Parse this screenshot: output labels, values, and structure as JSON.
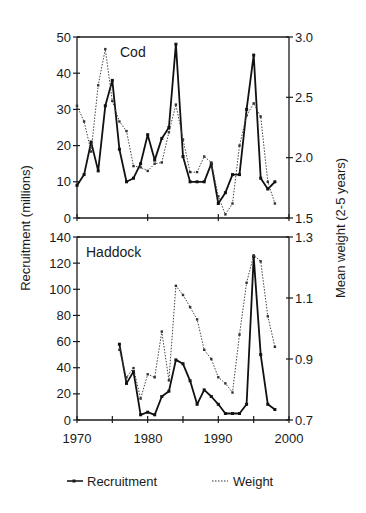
{
  "figure": {
    "left_axis_label": "Recruitment (millions)",
    "right_axis_label": "Mean weight (2-5 years)",
    "x_tick_labels": [
      "1970",
      "1980",
      "1990",
      "2000"
    ],
    "legend": {
      "recruitment": "Recruitment",
      "weight": "Weight"
    }
  },
  "chart_data": [
    {
      "type": "line",
      "title": "Cod",
      "xlabel": "",
      "ylabel": "Recruitment (millions)",
      "y2label": "Mean weight (2-5 years)",
      "xlim": [
        1970,
        2000
      ],
      "ylim": [
        0,
        50
      ],
      "y2lim": [
        1.5,
        3.0
      ],
      "yticks": [
        0,
        10,
        20,
        30,
        40,
        50
      ],
      "y2ticks": [
        1.5,
        2.0,
        2.5,
        3.0
      ],
      "xticks": [
        1970,
        1980,
        1990,
        2000
      ],
      "grid": false,
      "legend_position": "bottom",
      "x": [
        1970,
        1971,
        1972,
        1973,
        1974,
        1975,
        1976,
        1977,
        1978,
        1979,
        1980,
        1981,
        1982,
        1983,
        1984,
        1985,
        1986,
        1987,
        1988,
        1989,
        1990,
        1991,
        1992,
        1993,
        1994,
        1995,
        1996,
        1997,
        1998
      ],
      "series": [
        {
          "name": "Recruitment",
          "axis": "left",
          "style": "solid",
          "values": [
            9,
            12,
            21,
            13,
            31,
            38,
            19,
            10,
            11,
            15,
            23,
            16,
            22,
            25,
            48,
            17,
            10,
            10,
            10,
            15,
            4,
            7,
            12,
            12,
            30,
            45,
            11,
            8,
            10
          ]
        },
        {
          "name": "Weight",
          "axis": "right",
          "style": "dotted",
          "values": [
            2.43,
            2.3,
            2.05,
            2.6,
            2.9,
            2.47,
            2.3,
            2.22,
            1.93,
            1.92,
            1.89,
            1.95,
            1.96,
            2.21,
            2.44,
            2.15,
            1.88,
            1.88,
            2.01,
            1.96,
            1.68,
            1.53,
            1.62,
            2.1,
            2.35,
            2.45,
            2.34,
            1.8,
            1.62
          ]
        }
      ]
    },
    {
      "type": "line",
      "title": "Haddock",
      "xlabel": "",
      "ylabel": "Recruitment (millions)",
      "y2label": "Mean weight (2-5 years)",
      "xlim": [
        1970,
        2000
      ],
      "ylim": [
        0,
        140
      ],
      "y2lim": [
        0.7,
        1.3
      ],
      "yticks": [
        0,
        20,
        40,
        60,
        80,
        100,
        120,
        140
      ],
      "y2ticks": [
        0.7,
        0.9,
        1.1,
        1.3
      ],
      "xticks": [
        1970,
        1980,
        1990,
        2000
      ],
      "grid": false,
      "legend_position": "bottom",
      "x": [
        1976,
        1977,
        1978,
        1979,
        1980,
        1981,
        1982,
        1983,
        1984,
        1985,
        1986,
        1987,
        1988,
        1989,
        1990,
        1991,
        1992,
        1993,
        1994,
        1995,
        1996,
        1997,
        1998
      ],
      "series": [
        {
          "name": "Recruitment",
          "axis": "left",
          "style": "solid",
          "values": [
            58,
            28,
            37,
            4,
            6,
            4,
            18,
            22,
            46,
            43,
            30,
            12,
            23,
            18,
            12,
            5,
            5,
            5,
            12,
            125,
            50,
            12,
            8
          ]
        },
        {
          "name": "Weight",
          "axis": "right",
          "style": "dotted",
          "values": [
            0.93,
            0.84,
            0.87,
            0.77,
            0.85,
            0.84,
            0.99,
            0.83,
            1.14,
            1.11,
            1.07,
            1.03,
            0.93,
            0.9,
            0.84,
            0.82,
            0.79,
            0.98,
            1.15,
            1.24,
            1.22,
            1.04,
            0.94
          ]
        }
      ]
    }
  ]
}
